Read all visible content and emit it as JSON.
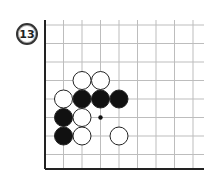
{
  "problem": {
    "number": "13"
  },
  "board": {
    "origin_x": 45,
    "origin_y": 25,
    "spacing_x": 18.5,
    "spacing_y": 18.5,
    "cols": 9,
    "rows": 8,
    "right_edge": 204,
    "bottom_edge": 169,
    "edges": {
      "left": true,
      "bottom": true
    },
    "line_color": "#bdbdbd",
    "edge_color": "#222222",
    "stone_radius": 9
  },
  "stones": [
    {
      "color": "white",
      "col": 2,
      "row": 3
    },
    {
      "color": "white",
      "col": 3,
      "row": 3
    },
    {
      "color": "white",
      "col": 1,
      "row": 4
    },
    {
      "color": "black",
      "col": 2,
      "row": 4
    },
    {
      "color": "black",
      "col": 3,
      "row": 4
    },
    {
      "color": "black",
      "col": 4,
      "row": 4
    },
    {
      "color": "black",
      "col": 1,
      "row": 5
    },
    {
      "color": "white",
      "col": 2,
      "row": 5
    },
    {
      "color": "black",
      "col": 1,
      "row": 6
    },
    {
      "color": "white",
      "col": 2,
      "row": 6
    },
    {
      "color": "white",
      "col": 4,
      "row": 6
    }
  ],
  "marks": [
    {
      "type": "dot",
      "col": 3,
      "row": 5
    }
  ]
}
